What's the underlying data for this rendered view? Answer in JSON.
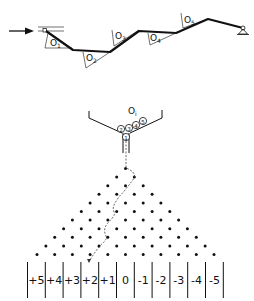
{
  "mechanism": {
    "input_arrow": "right-arrow",
    "obstacles": [
      {
        "label": "O",
        "sub": "1"
      },
      {
        "label": "O",
        "sub": "2"
      },
      {
        "label": "O",
        "sub": "3"
      },
      {
        "label": "O",
        "sub": "4"
      },
      {
        "label": "O",
        "sub": "5"
      }
    ],
    "end_support": "pin-support"
  },
  "funnel": {
    "label": "O",
    "sub": "i",
    "balls": [
      "1",
      "2",
      "3",
      "4",
      "5"
    ]
  },
  "galton_board": {
    "rows": 10,
    "path": "dashed-zigzag"
  },
  "bins": {
    "labels": [
      "+5",
      "+4",
      "+3",
      "+2",
      "+1",
      "0",
      "-1",
      "-2",
      "-3",
      "-4",
      "-5"
    ]
  }
}
